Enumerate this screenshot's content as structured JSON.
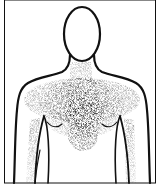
{
  "figure": {
    "title": "Chest pain radiation pattern",
    "annotation": "Stippled shading concentrated at center of chest, radiating to neck, shoulders, and inner left/right arms",
    "colors": {
      "background": "#ffffff",
      "outline": "#111111",
      "stipple": "#000000"
    },
    "regions": [
      {
        "name": "central-chest",
        "intensity": "high"
      },
      {
        "name": "neck",
        "intensity": "low"
      },
      {
        "name": "left-shoulder",
        "intensity": "medium"
      },
      {
        "name": "right-shoulder",
        "intensity": "medium"
      },
      {
        "name": "left-inner-arm",
        "intensity": "low"
      },
      {
        "name": "right-inner-arm",
        "intensity": "low"
      },
      {
        "name": "upper-abdomen",
        "intensity": "medium"
      }
    ]
  }
}
